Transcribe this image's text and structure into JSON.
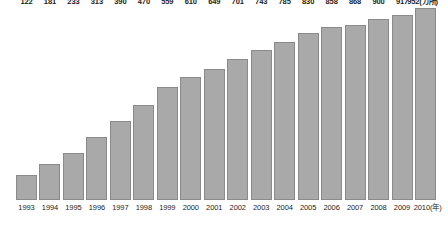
{
  "chart_data": {
    "type": "bar",
    "title": "",
    "subtitle": "",
    "xlabel": "(年)",
    "ylabel": "(カ所)",
    "value_unit_suffix": "(カ所)",
    "year_unit_suffix": "(年)",
    "grid": false,
    "legend": "none",
    "ylim": [
      0,
      952
    ],
    "categories": [
      "1993",
      "1994",
      "1995",
      "1996",
      "1997",
      "1998",
      "1999",
      "2000",
      "2001",
      "2002",
      "2003",
      "2004",
      "2005",
      "2006",
      "2007",
      "2008",
      "2009",
      "2010"
    ],
    "values": [
      122,
      181,
      233,
      313,
      390,
      470,
      559,
      610,
      649,
      701,
      743,
      785,
      830,
      858,
      868,
      900,
      917,
      952
    ],
    "value_labels": [
      "122",
      "181",
      "233",
      "313",
      "390",
      "470",
      "559",
      "610",
      "649",
      "701",
      "743",
      "785",
      "830",
      "858",
      "868",
      "900",
      "917",
      "952(カ所)"
    ],
    "tick_labels": [
      "1993",
      "1994",
      "1995",
      "1996",
      "1997",
      "1998",
      "1999",
      "2000",
      "2001",
      "2002",
      "2003",
      "2004",
      "2005",
      "2006",
      "2007",
      "2008",
      "2009",
      "2010(年)"
    ],
    "colors": {
      "bar_fill": "#a9a9a9",
      "bar_border": "#8a8a8a",
      "text": "#1c1c1c",
      "background": "#ffffff"
    }
  }
}
